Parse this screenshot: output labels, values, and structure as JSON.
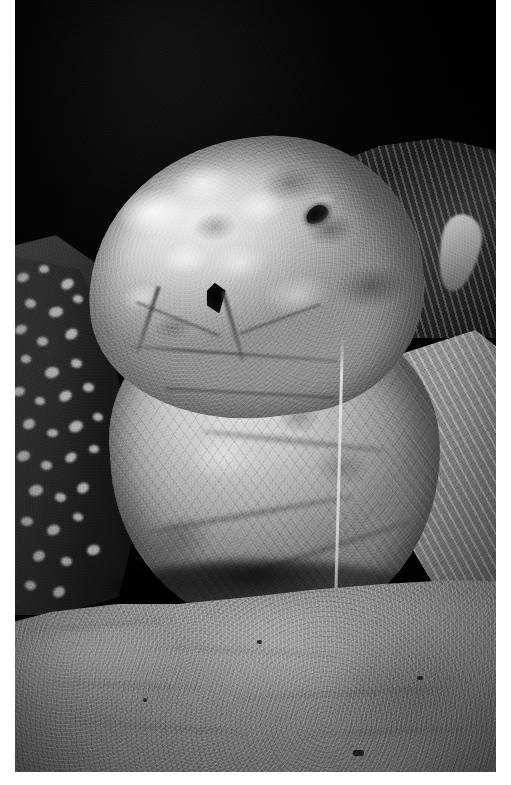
{
  "page": {
    "type": "photograph",
    "orientation": "portrait",
    "width_px": 511,
    "height_px": 785,
    "color_mode": "black-and-white",
    "background_color": "#ffffff"
  },
  "photo": {
    "name": "leatherback-sea-turtle-photo",
    "subject": "sea turtle head and neck on beach at night",
    "species_appearance": "leatherback sea turtle",
    "frame": {
      "left_px": 15,
      "top_px": 0,
      "width_px": 481,
      "height_px": 772
    },
    "palette": {
      "background_black": "#0a0a0a",
      "deep_shadow": "#131313",
      "mid_shadow": "#3a3a3a",
      "skin_midtone": "#9a9a9a",
      "skin_highlight": "#e7e7e7",
      "sand_tone": "#8b8b8b",
      "paper_white": "#ffffff"
    },
    "regions": [
      {
        "id": "night-sky",
        "label": "dark night background",
        "tone": "near black"
      },
      {
        "id": "turtle-head",
        "label": "turtle head with mottled pale skin",
        "tone": "light grey with white patches"
      },
      {
        "id": "turtle-eye",
        "label": "eye",
        "tone": "black"
      },
      {
        "id": "nostril",
        "label": "nostril opening",
        "tone": "black"
      },
      {
        "id": "throat-neck",
        "label": "throat and neck with scale texture",
        "tone": "mid grey"
      },
      {
        "id": "left-flipper",
        "label": "dark spotted front flipper",
        "tone": "dark with pale spots"
      },
      {
        "id": "right-flipper",
        "label": "right flipper and carapace ridge",
        "tone": "dark grey ridged"
      },
      {
        "id": "sand",
        "label": "sandy beach foreground",
        "tone": "mid grey granular"
      },
      {
        "id": "drip-strand",
        "label": "pale strand hanging from mouth to sand",
        "tone": "light grey"
      }
    ]
  },
  "spots": {
    "description": "pale spots on dark left flipper",
    "items": [
      {
        "x": 10,
        "y": 18,
        "w": 12,
        "h": 9,
        "r": -14
      },
      {
        "x": 32,
        "y": 10,
        "w": 10,
        "h": 8,
        "r": 8
      },
      {
        "x": 54,
        "y": 24,
        "w": 13,
        "h": 10,
        "r": -22
      },
      {
        "x": 18,
        "y": 44,
        "w": 11,
        "h": 9,
        "r": 16
      },
      {
        "x": 42,
        "y": 52,
        "w": 14,
        "h": 10,
        "r": -8
      },
      {
        "x": 66,
        "y": 40,
        "w": 10,
        "h": 8,
        "r": 24
      },
      {
        "x": 8,
        "y": 70,
        "w": 12,
        "h": 9,
        "r": -18
      },
      {
        "x": 30,
        "y": 82,
        "w": 11,
        "h": 9,
        "r": 6
      },
      {
        "x": 58,
        "y": 74,
        "w": 13,
        "h": 10,
        "r": -26
      },
      {
        "x": 14,
        "y": 100,
        "w": 10,
        "h": 8,
        "r": 12
      },
      {
        "x": 38,
        "y": 112,
        "w": 14,
        "h": 11,
        "r": -10
      },
      {
        "x": 64,
        "y": 104,
        "w": 11,
        "h": 9,
        "r": 20
      },
      {
        "x": 6,
        "y": 132,
        "w": 12,
        "h": 9,
        "r": -6
      },
      {
        "x": 28,
        "y": 142,
        "w": 10,
        "h": 8,
        "r": 18
      },
      {
        "x": 52,
        "y": 136,
        "w": 13,
        "h": 10,
        "r": -24
      },
      {
        "x": 76,
        "y": 128,
        "w": 11,
        "h": 9,
        "r": 10
      },
      {
        "x": 16,
        "y": 164,
        "w": 12,
        "h": 10,
        "r": -16
      },
      {
        "x": 40,
        "y": 174,
        "w": 11,
        "h": 8,
        "r": 4
      },
      {
        "x": 62,
        "y": 166,
        "w": 14,
        "h": 11,
        "r": -20
      },
      {
        "x": 86,
        "y": 158,
        "w": 10,
        "h": 8,
        "r": 22
      },
      {
        "x": 10,
        "y": 196,
        "w": 13,
        "h": 10,
        "r": -12
      },
      {
        "x": 34,
        "y": 206,
        "w": 11,
        "h": 9,
        "r": 14
      },
      {
        "x": 58,
        "y": 198,
        "w": 12,
        "h": 9,
        "r": -28
      },
      {
        "x": 82,
        "y": 190,
        "w": 10,
        "h": 8,
        "r": 8
      },
      {
        "x": 22,
        "y": 230,
        "w": 14,
        "h": 11,
        "r": -10
      },
      {
        "x": 48,
        "y": 238,
        "w": 11,
        "h": 9,
        "r": 18
      },
      {
        "x": 70,
        "y": 228,
        "w": 12,
        "h": 10,
        "r": -22
      },
      {
        "x": 14,
        "y": 262,
        "w": 12,
        "h": 9,
        "r": 6
      },
      {
        "x": 40,
        "y": 270,
        "w": 13,
        "h": 10,
        "r": -14
      },
      {
        "x": 66,
        "y": 258,
        "w": 10,
        "h": 8,
        "r": 26
      },
      {
        "x": 26,
        "y": 296,
        "w": 12,
        "h": 10,
        "r": -18
      },
      {
        "x": 54,
        "y": 302,
        "w": 11,
        "h": 9,
        "r": 12
      },
      {
        "x": 80,
        "y": 290,
        "w": 13,
        "h": 10,
        "r": -8
      },
      {
        "x": 18,
        "y": 326,
        "w": 11,
        "h": 9,
        "r": 20
      },
      {
        "x": 46,
        "y": 332,
        "w": 12,
        "h": 10,
        "r": -24
      }
    ]
  },
  "sand_ripples": [
    {
      "x": 20,
      "y": 44,
      "w": 150,
      "r": -4
    },
    {
      "x": 150,
      "y": 70,
      "w": 190,
      "r": 3
    },
    {
      "x": 40,
      "y": 104,
      "w": 160,
      "r": 2
    },
    {
      "x": 230,
      "y": 112,
      "w": 220,
      "r": -3
    },
    {
      "x": 60,
      "y": 146,
      "w": 200,
      "r": 4
    },
    {
      "x": 300,
      "y": 150,
      "w": 170,
      "r": -2
    }
  ],
  "sand_pebbles": [
    {
      "x": 138,
      "y": 118,
      "w": 4,
      "h": 4
    },
    {
      "x": 348,
      "y": 170,
      "w": 11,
      "h": 6
    },
    {
      "x": 252,
      "y": 60,
      "w": 5,
      "h": 4
    },
    {
      "x": 412,
      "y": 96,
      "w": 6,
      "h": 4
    }
  ],
  "neck_creases": [
    {
      "x": 40,
      "y": 62,
      "w": 150,
      "h": 4,
      "r": 18
    },
    {
      "x": 90,
      "y": 140,
      "w": 190,
      "h": 5,
      "r": 10
    },
    {
      "x": 30,
      "y": 210,
      "w": 210,
      "h": 5,
      "r": -6
    },
    {
      "x": 120,
      "y": 250,
      "w": 180,
      "h": 4,
      "r": -14
    }
  ],
  "beak_ridges": [
    {
      "x": 118,
      "y": 318,
      "w": 90,
      "h": 3,
      "r": 22
    },
    {
      "x": 222,
      "y": 318,
      "w": 86,
      "h": 3,
      "r": -20
    },
    {
      "x": 150,
      "y": 392,
      "w": 170,
      "h": 3,
      "r": 3
    }
  ]
}
